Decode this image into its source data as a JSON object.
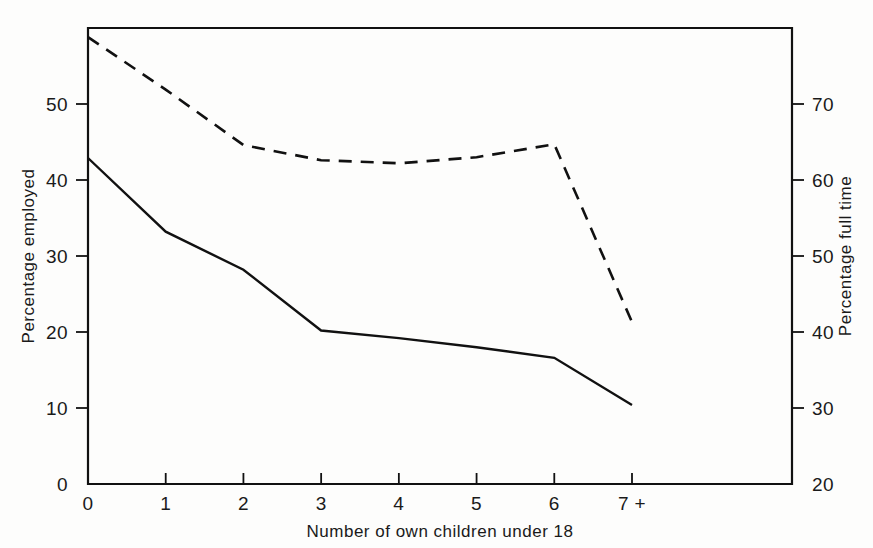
{
  "chart_data": {
    "type": "line",
    "title": "",
    "xlabel": "Number of own children under 18",
    "ylabel": "Percentage employed",
    "y2label": "Percentage full time",
    "categories": [
      "0",
      "1",
      "2",
      "3",
      "4",
      "5",
      "6",
      "7 +"
    ],
    "x": [
      0,
      1,
      2,
      3,
      4,
      5,
      6,
      7
    ],
    "ylim": [
      0,
      60
    ],
    "y2lim": [
      20,
      80
    ],
    "yticks": [
      "0",
      "10",
      "20",
      "30",
      "40",
      "50"
    ],
    "ytick_values": [
      0,
      10,
      20,
      30,
      40,
      50
    ],
    "y2ticks": [
      "20",
      "30",
      "40",
      "50",
      "60",
      "70"
    ],
    "y2tick_values": [
      20,
      30,
      40,
      50,
      60,
      70
    ],
    "xticks": [
      "0",
      "1",
      "2",
      "3",
      "4",
      "5",
      "6",
      "7 +"
    ],
    "grid": false,
    "legend": "none",
    "series": [
      {
        "name": "Percentage employed",
        "axis": "left",
        "style": "solid",
        "values": [
          42.9,
          33.2,
          28.2,
          20.2,
          19.2,
          18.0,
          16.6,
          10.4
        ]
      },
      {
        "name": "Percentage full time",
        "axis": "right",
        "style": "dashed",
        "values": [
          78.8,
          71.9,
          64.6,
          62.6,
          62.2,
          63.0,
          64.7,
          41.3
        ]
      }
    ],
    "annotations": []
  },
  "figure": {
    "background_color": "#fdfdfc",
    "ink_color": "#111111"
  }
}
